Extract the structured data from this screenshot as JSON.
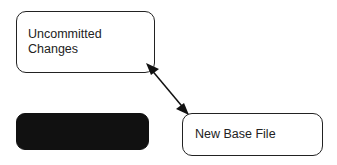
{
  "diagram": {
    "nodes": [
      {
        "id": "uncommitted",
        "label_line1": "Uncommitted",
        "label_line2": "Changes"
      },
      {
        "id": "new-base",
        "label": "New Base File"
      },
      {
        "id": "redacted",
        "label": ""
      }
    ],
    "edges": [
      {
        "from": "uncommitted",
        "to": "new-base",
        "bidirectional": true
      }
    ]
  }
}
